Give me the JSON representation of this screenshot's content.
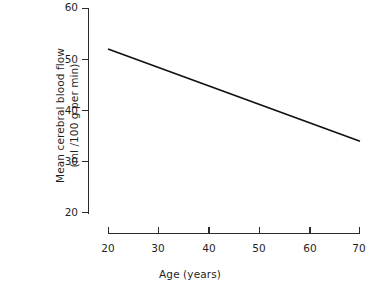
{
  "chart_data": {
    "type": "line",
    "title": "",
    "subtitle": "",
    "xlabel": "Age (years)",
    "ylabel_line1": "Mean cerebral blood flow",
    "ylabel_line2": "(ml /100 g per min)",
    "ylabel": "Mean cerebral blood flow (ml /100 g per min)",
    "xlim": [
      20,
      70
    ],
    "ylim": [
      20,
      60
    ],
    "xticks": [
      20,
      30,
      40,
      50,
      60,
      70
    ],
    "yticks": [
      20,
      30,
      40,
      50,
      60
    ],
    "xticklabels": [
      "20",
      "30",
      "40",
      "50",
      "60",
      "70"
    ],
    "yticklabels": [
      "20",
      "30",
      "40",
      "50",
      "60"
    ],
    "grid": false,
    "legend": false,
    "legend_position": "none",
    "series": [
      {
        "name": "Mean cerebral blood flow",
        "color": "#101010",
        "x": [
          20,
          70
        ],
        "values": [
          52,
          34
        ]
      }
    ]
  },
  "axes": {
    "y_tick_labels": [
      "60",
      "50",
      "40",
      "30",
      "20"
    ],
    "x_tick_labels": [
      "20",
      "30",
      "40",
      "50",
      "60",
      "70"
    ]
  },
  "colors": {
    "ink": "#1f1f1f",
    "line": "#101010",
    "spine": "#2b2b2b",
    "background": "#ffffff"
  }
}
